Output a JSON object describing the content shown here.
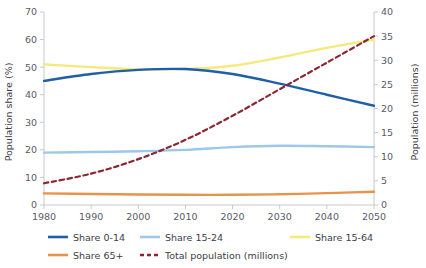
{
  "chart_data": {
    "type": "line",
    "title": "",
    "xlabel": "",
    "ylabel": "Population share (%)",
    "y2label": "Population (millions)",
    "x": [
      1980,
      1990,
      2000,
      2010,
      2020,
      2030,
      2040,
      2050
    ],
    "xlim": [
      1980,
      2050
    ],
    "ylim": [
      0,
      70
    ],
    "y2lim": [
      0,
      40
    ],
    "xticks": [
      "1980",
      "1990",
      "2000",
      "2010",
      "2020",
      "2030",
      "2040",
      "2050"
    ],
    "yticks": [
      "0",
      "10",
      "20",
      "30",
      "40",
      "50",
      "60",
      "70"
    ],
    "y2ticks": [
      "0",
      "5",
      "10",
      "15",
      "20",
      "25",
      "30",
      "35",
      "40"
    ],
    "grid": false,
    "legend_position": "bottom",
    "series": [
      {
        "name": "Share 0-14",
        "color": "#1f5fa9",
        "axis": "left",
        "style": "solid",
        "values": [
          45.0,
          47.5,
          49.0,
          49.3,
          47.5,
          44.0,
          40.0,
          36.0
        ]
      },
      {
        "name": "Share 15-24",
        "color": "#9dc8e8",
        "axis": "left",
        "style": "solid",
        "values": [
          19.0,
          19.2,
          19.5,
          20.0,
          21.0,
          21.5,
          21.3,
          21.0
        ]
      },
      {
        "name": "Share 15-64",
        "color": "#f5e97a",
        "axis": "left",
        "style": "solid",
        "values": [
          51.0,
          50.0,
          49.2,
          49.3,
          50.5,
          53.5,
          57.0,
          60.0
        ]
      },
      {
        "name": "Share 65+",
        "color": "#e8924a",
        "axis": "left",
        "style": "solid",
        "values": [
          4.2,
          4.0,
          3.8,
          3.7,
          3.7,
          3.9,
          4.3,
          4.8
        ]
      },
      {
        "name": "Total population (millions)",
        "color": "#8c2633",
        "axis": "right",
        "style": "dashed",
        "values": [
          4.5,
          6.5,
          9.5,
          13.5,
          18.5,
          24.0,
          29.5,
          35.0
        ]
      }
    ]
  },
  "legend": {
    "items": [
      {
        "label": "Share 0-14"
      },
      {
        "label": "Share 15-24"
      },
      {
        "label": "Share 15-64"
      },
      {
        "label": "Share 65+"
      },
      {
        "label": "Total population (millions)"
      }
    ]
  }
}
